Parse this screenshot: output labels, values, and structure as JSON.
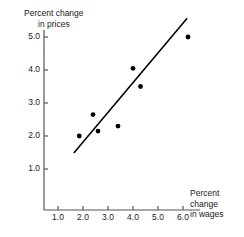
{
  "chart_data": {
    "type": "scatter",
    "title": "",
    "xlabel": "Percent change in wages",
    "ylabel": "Percent change in prices",
    "xlabel_lines": [
      "Percent",
      "change",
      "in wages"
    ],
    "ylabel_lines": [
      "Percent change",
      "in prices"
    ],
    "xticks": [
      "1.0",
      "2.0",
      "3.0",
      "4.0",
      "5.0",
      "6.0"
    ],
    "xtick_values": [
      1.0,
      2.0,
      3.0,
      4.0,
      5.0,
      6.0
    ],
    "yticks": [
      "1.0",
      "2.0",
      "3.0",
      "4.0",
      "5.0"
    ],
    "ytick_values": [
      1.0,
      2.0,
      3.0,
      4.0,
      5.0
    ],
    "xlim": [
      0.45,
      6.6
    ],
    "ylim": [
      0.3,
      5.75
    ],
    "grid": false,
    "legend": "none",
    "marker": "filled-circle",
    "marker_color": "#000000",
    "line_color": "#000000",
    "axis_color": "#555555",
    "points": [
      {
        "x": 1.85,
        "y": 2.0
      },
      {
        "x": 2.4,
        "y": 2.65
      },
      {
        "x": 2.6,
        "y": 2.15
      },
      {
        "x": 3.4,
        "y": 2.3
      },
      {
        "x": 4.0,
        "y": 4.05
      },
      {
        "x": 4.3,
        "y": 3.5
      },
      {
        "x": 6.2,
        "y": 5.0
      }
    ],
    "trend_line": {
      "x1": 1.65,
      "y1": 1.5,
      "x2": 6.15,
      "y2": 5.55
    }
  }
}
